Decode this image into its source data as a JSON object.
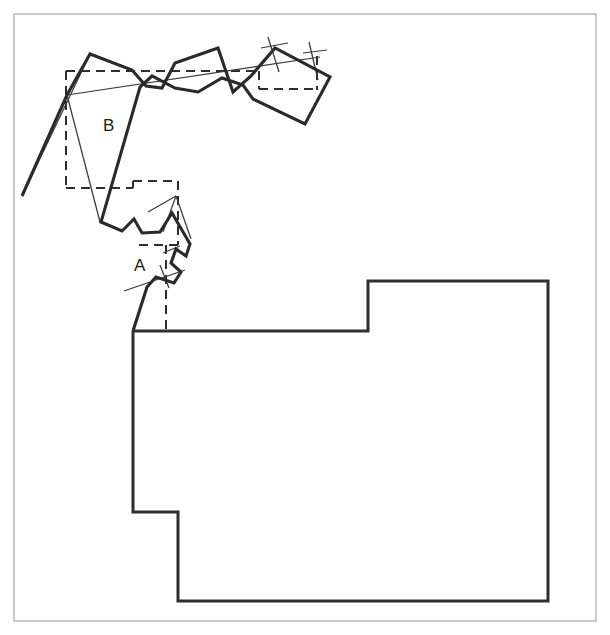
{
  "figure": {
    "background_color": "#ffffff",
    "width": 610,
    "height": 635,
    "frame": {
      "name": "outer-border",
      "x": 14,
      "y": 14,
      "width": 582,
      "height": 607,
      "stroke": "#b4b4b4",
      "stroke_width": 1.4
    },
    "labels": [
      {
        "id": "label-b",
        "text": "B",
        "x": 103,
        "y": 131,
        "font_size": 17,
        "color": "#1d1d1d"
      },
      {
        "id": "label-a",
        "text": "A",
        "x": 134,
        "y": 271,
        "font_size": 17,
        "color": "#1d1d1d"
      }
    ],
    "colors": {
      "thick_line": "#2a2a2a",
      "main_polygon": "#2f2f2f",
      "thin_line": "#3a3a3a",
      "dashed_line": "#2e2e2e",
      "frame": "#b4b4b4",
      "background": "#ffffff"
    },
    "shapes": {
      "main_polygon": {
        "name": "floor-plan-polygon",
        "stroke": "#2f2f2f",
        "stroke_width": 3.0,
        "closed": true,
        "points": [
          [
            133,
            331
          ],
          [
            368,
            331
          ],
          [
            368,
            281
          ],
          [
            548,
            281
          ],
          [
            548,
            601
          ],
          [
            178,
            601
          ],
          [
            178,
            512
          ],
          [
            133,
            512
          ]
        ]
      },
      "dashed_outline": {
        "name": "dashed-reference-outline",
        "stroke": "#2e2e2e",
        "stroke_width": 2.0,
        "dash": "9 6",
        "closed": false,
        "segments": [
          [
            [
              66,
              71
            ],
            [
              66,
              188
            ]
          ],
          [
            [
              66,
              188
            ],
            [
              133,
              188
            ]
          ],
          [
            [
              133,
              188
            ],
            [
              133,
              181
            ]
          ],
          [
            [
              133,
              181
            ],
            [
              178,
              181
            ]
          ],
          [
            [
              178,
              181
            ],
            [
              178,
              245
            ]
          ],
          [
            [
              178,
              245
            ],
            [
              133,
              245
            ]
          ],
          [
            [
              66,
              71
            ],
            [
              259,
              71
            ]
          ],
          [
            [
              259,
              71
            ],
            [
              259,
              89
            ]
          ],
          [
            [
              259,
              89
            ],
            [
              318,
              89
            ]
          ],
          [
            [
              317,
              56
            ],
            [
              317,
              90
            ]
          ],
          [
            [
              166,
              245
            ],
            [
              166,
              331
            ]
          ]
        ]
      },
      "thick_polyline": {
        "name": "traced-boundary-polyline",
        "stroke": "#2a2a2a",
        "stroke_width": 3.1,
        "closed": false,
        "points": [
          [
            22,
            196
          ],
          [
            67,
            95
          ],
          [
            90,
            54
          ],
          [
            132,
            70
          ],
          [
            146,
            86
          ],
          [
            162,
            88
          ],
          [
            175,
            63
          ],
          [
            218,
            48
          ],
          [
            233,
            92
          ],
          [
            251,
            76
          ],
          [
            275,
            48
          ],
          [
            330,
            77
          ],
          [
            305,
            124
          ],
          [
            253,
            99
          ],
          [
            243,
            85
          ],
          [
            222,
            78
          ],
          [
            198,
            92
          ],
          [
            175,
            88
          ],
          [
            152,
            76
          ],
          [
            140,
            87
          ],
          [
            101,
            222
          ],
          [
            122,
            231
          ],
          [
            134,
            219
          ],
          [
            142,
            233
          ],
          [
            160,
            232
          ],
          [
            172,
            213
          ],
          [
            190,
            244
          ],
          [
            186,
            256
          ],
          [
            176,
            249
          ],
          [
            171,
            263
          ],
          [
            181,
            272
          ],
          [
            174,
            283
          ],
          [
            156,
            277
          ],
          [
            147,
            287
          ],
          [
            133,
            331
          ]
        ]
      },
      "thin_lines": {
        "name": "thin-construction-lines",
        "stroke": "#3a3a3a",
        "stroke_width": 1.25,
        "segments": [
          [
            [
              67,
              95
            ],
            [
              100,
              222
            ]
          ],
          [
            [
              67,
              95
            ],
            [
              320,
              57
            ]
          ],
          [
            [
              22,
              196
            ],
            [
              90,
              54
            ]
          ],
          [
            [
              148,
              212
            ],
            [
              176,
              196
            ]
          ],
          [
            [
              176,
              196
            ],
            [
              191,
              239
            ]
          ],
          [
            [
              176,
              196
            ],
            [
              163,
              232
            ]
          ],
          [
            [
              124,
              291
            ],
            [
              185,
              270
            ]
          ],
          [
            [
              268,
              37
            ],
            [
              279,
              72
            ]
          ],
          [
            [
              261,
              48
            ],
            [
              288,
              43
            ]
          ],
          [
            [
              309,
              42
            ],
            [
              318,
              80
            ]
          ],
          [
            [
              303,
              53
            ],
            [
              327,
              50
            ]
          ],
          [
            [
              160,
              265
            ],
            [
              169,
              288
            ]
          ],
          [
            [
              163,
              253
            ],
            [
              180,
              246
            ]
          ]
        ]
      }
    }
  }
}
